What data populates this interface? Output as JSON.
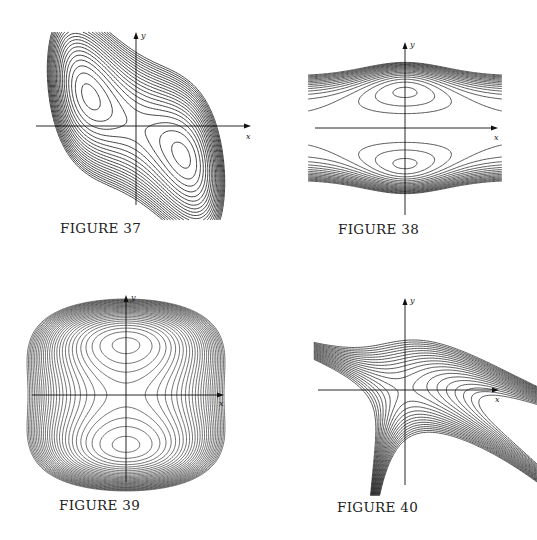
{
  "page": {
    "figures": [
      {
        "id": "fig37",
        "caption": "FIGURE 37",
        "x_label": "x",
        "y_label": "y",
        "description": "Closed contour curves forming a slanted S-shaped double-well region; two elliptical centers in quadrants II and IV, saddle at origin"
      },
      {
        "id": "fig38",
        "caption": "FIGURE 38",
        "x_label": "x",
        "y_label": "y",
        "description": "Bell-shaped contour family, two closed centers on the y-axis above and below the x-axis, open curves extending left/right"
      },
      {
        "id": "fig39",
        "caption": "FIGURE 39",
        "x_label": "x",
        "y_label": "y",
        "description": "Barrel-shaped contour family with two closed centers on the y-axis and saddle at origin, dense outer curves"
      },
      {
        "id": "fig40",
        "caption": "FIGURE 40",
        "x_label": "x",
        "y_label": "y",
        "description": "Asymmetric contour family with one closed center in quadrant II, saddle at origin, branches extending to upper right and lower left"
      }
    ]
  }
}
